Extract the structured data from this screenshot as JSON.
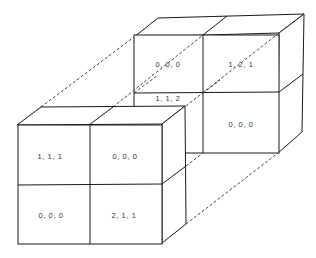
{
  "diagram": {
    "back_block": {
      "cells": [
        {
          "id": "back-top-left",
          "label": "0, 0, 0"
        },
        {
          "id": "back-top-right",
          "label": "1, 2, 1"
        },
        {
          "id": "back-bottom-left",
          "label": "1, 1, 2"
        },
        {
          "id": "back-bottom-right",
          "label": "0, 0, 0"
        }
      ]
    },
    "front_block": {
      "cells": [
        {
          "id": "front-top-left",
          "label": "1, 1, 1"
        },
        {
          "id": "front-top-right",
          "label": "0, 0, 0"
        },
        {
          "id": "front-bottom-left",
          "label": "0, 0, 0"
        },
        {
          "id": "front-bottom-right",
          "label": "2, 1, 1"
        }
      ]
    }
  }
}
